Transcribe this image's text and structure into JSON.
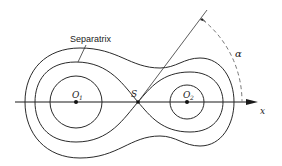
{
  "diagram": {
    "labels": {
      "separatrix": "Separatrix",
      "saddle_point": "S",
      "focus_1_main": "O",
      "focus_1_sub": "1",
      "focus_2_main": "O",
      "focus_2_sub": "2",
      "x_axis": "x",
      "angle": "α"
    },
    "colors": {
      "line": "#2a2a2a",
      "dashed_arc": "#777777",
      "background": "#ffffff"
    }
  }
}
